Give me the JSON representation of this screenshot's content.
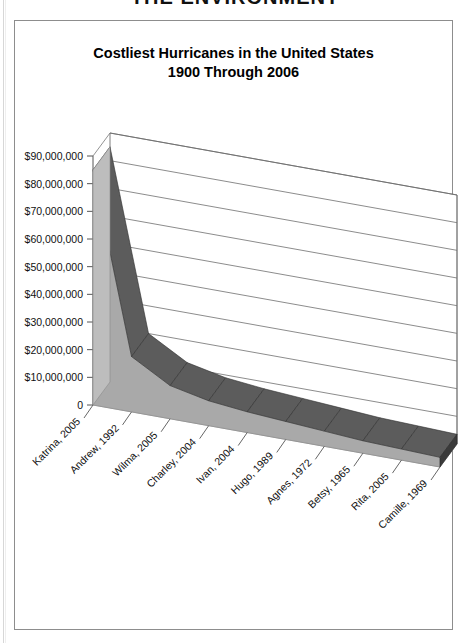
{
  "banner": {
    "text": "THE ENVIRONMENT"
  },
  "chart_frame": {
    "border_color": "#8d8d8d"
  },
  "chart_data": {
    "type": "area",
    "title": "Costliest Hurricanes in the United States",
    "subtitle": "1900 Through 2006",
    "title_line1": "Costliest Hurricanes in the United States",
    "title_line2": "1900 Through 2006",
    "xlabel": "",
    "ylabel": "",
    "ylim": [
      0,
      90000000
    ],
    "grid": true,
    "legend": "none",
    "three_d": true,
    "categories": [
      "Katrina, 2005",
      "Andrew, 1992",
      "Wilma, 2005",
      "Charley, 2004",
      "Ivan, 2004",
      "Hugo, 1989",
      "Agnes, 1972",
      "Betsy, 1965",
      "Rita, 2005",
      "Camille, 1969"
    ],
    "values": [
      85000000,
      20000000,
      12000000,
      9000000,
      7500000,
      6500000,
      5500000,
      4500000,
      4000000,
      3500000
    ],
    "ytick_labels": [
      "$90,000,000",
      "$80,000,000",
      "$70,000,000",
      "$60,000,000",
      "$50,000,000",
      "$40,000,000",
      "$30,000,000",
      "$20,000,000",
      "$10,000,000",
      "0"
    ],
    "ytick_values": [
      90000000,
      80000000,
      70000000,
      60000000,
      50000000,
      40000000,
      30000000,
      20000000,
      10000000,
      0
    ],
    "colors": {
      "area_fill": "#a9a9a9",
      "ribbon_top": "#5c5c5c",
      "ribbon_end": "#3a3a3a",
      "floor": "#e2e2e2",
      "gridline": "#6f6f6f",
      "wall": "#ffffff"
    }
  }
}
